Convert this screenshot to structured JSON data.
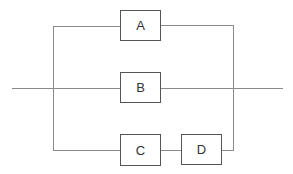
{
  "diagram": {
    "type": "reliability-block-diagram",
    "blocks": [
      {
        "id": "A",
        "label": "A"
      },
      {
        "id": "B",
        "label": "B"
      },
      {
        "id": "C",
        "label": "C"
      },
      {
        "id": "D",
        "label": "D"
      }
    ],
    "structure": "parallel branches: A | B | (C series D)",
    "colors": {
      "line": "#8a8a8a",
      "box_border": "#555555",
      "text": "#333333"
    }
  }
}
